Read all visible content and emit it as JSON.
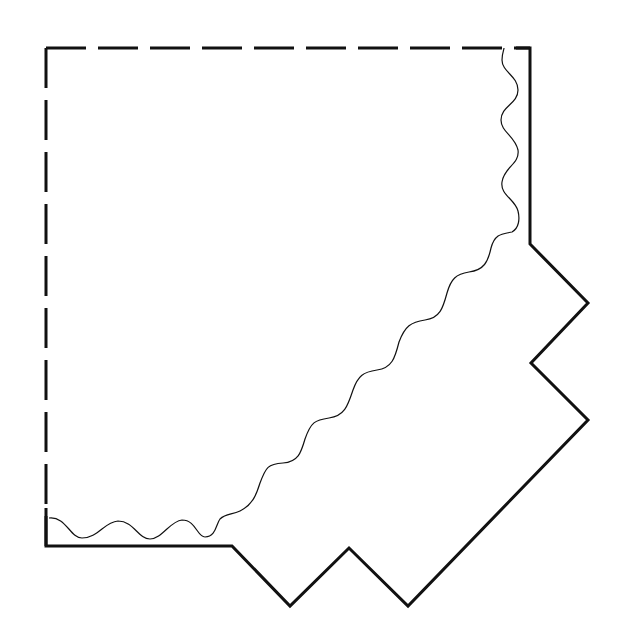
{
  "diagram": {
    "canvas": {
      "width": 624,
      "height": 637,
      "background": "#ffffff"
    },
    "stroke_color": "#111111",
    "dashed_edges": {
      "top": {
        "x1": 46,
        "y1": 48,
        "x2": 530,
        "y2": 48
      },
      "left": {
        "x1": 46,
        "y1": 48,
        "x2": 46,
        "y2": 546
      }
    },
    "solid_outline_points": "46,508 46,546 232,546 290,606 349,548 408,606 588,420 531,363 588,303 530,244 530,48 516,48",
    "wavy_cut_path": "M 49,518 C 66,516 70,538 82,538 C 98,538 104,522 118,521 C 134,521 138,539 150,539 C 162,539 170,521 182,520 C 196,520 197,537 205,537 C 216,537 216,524 220,519 C 226,513 232,515 240,511 C 252,505 256,496 260,483 C 266,467 268,464 283,463 C 298,462 301,453 305,439 C 311,422 315,420 329,418 C 345,416 348,405 353,390 C 358,376 363,372 377,370 C 392,368 395,358 399,342 C 405,326 411,322 425,320 C 440,318 443,308 447,293 C 451,279 456,274 469,272 C 484,270 488,262 491,248 C 495,233 503,234 512,232 C 519,228 520,219 518,211 C 515,199 500,195 502,182 C 504,167 520,164 518,150 C 515,136 501,132 501,120 C 501,106 518,104 518,90 C 518,76 502,72 502,60 C 502,53 504,50 504,48",
    "line_widths": {
      "outline": 3,
      "dashed": 3,
      "wavy": 1.2
    }
  }
}
